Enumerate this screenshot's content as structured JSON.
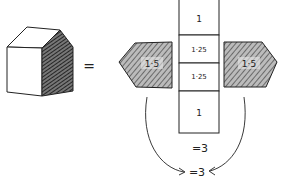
{
  "diagram": {
    "house": {
      "description": "3D house-like solid with shaded pentagonal side face"
    },
    "equals_sign": "=",
    "net": {
      "column_cells": [
        {
          "label": "1"
        },
        {
          "label": "1·25"
        },
        {
          "label": "1·25"
        },
        {
          "label": "1"
        }
      ],
      "left_pentagon": {
        "label": "1·5"
      },
      "right_pentagon": {
        "label": "1·5"
      }
    },
    "column_sum": "=3",
    "pentagons_sum": "=3"
  },
  "colors": {
    "ink": "#222222",
    "shade": "#555555",
    "background": "#ffffff"
  }
}
